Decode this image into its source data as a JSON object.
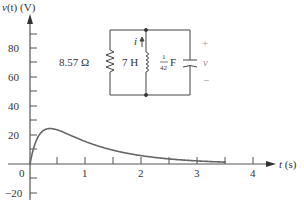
{
  "chart_data": {
    "type": "line",
    "title": "",
    "xlabel": "t (s)",
    "ylabel": "v(t) (V)",
    "xlim": [
      0,
      4.3
    ],
    "ylim": [
      -25,
      95
    ],
    "x_ticks": [
      0,
      0.5,
      1,
      1.5,
      2,
      2.5,
      3,
      3.5,
      4
    ],
    "x_tick_labels": [
      "0",
      "1",
      "2",
      "3",
      "4"
    ],
    "y_ticks": [
      -20,
      -10,
      10,
      20,
      30,
      40,
      50,
      60,
      70,
      80,
      90
    ],
    "y_tick_labels": [
      "80",
      "60",
      "40",
      "20",
      "-20"
    ],
    "grid": false,
    "series": [
      {
        "name": "v(t)",
        "x": [
          0,
          0.05,
          0.1,
          0.15,
          0.2,
          0.25,
          0.3,
          0.36,
          0.45,
          0.5,
          0.6,
          0.75,
          1.0,
          1.25,
          1.5,
          1.75,
          2.0,
          2.25,
          2.5,
          2.75,
          3.0,
          3.25,
          3.5
        ],
        "values": [
          0,
          17.8,
          29.9,
          38.3,
          44.1,
          47.9,
          50.0,
          51.3,
          51.4,
          44.3,
          46.1,
          39.6,
          30.7,
          23.6,
          18.7,
          14.6,
          11.4,
          8.8,
          6.9,
          5.4,
          4.2,
          3.3,
          2.5
        ]
      }
    ],
    "annotations": {
      "circuit": {
        "resistor": "8.57 Ω",
        "inductor": "7 H",
        "capacitor_num": "1",
        "capacitor_den": "42",
        "capacitor_unit": "F",
        "current_label": "i",
        "voltage_label": "v",
        "plus": "+",
        "minus": "−"
      }
    }
  },
  "labels": {
    "ylabel_v": "v",
    "ylabel_t": "(t) (V)",
    "xlabel_t": "t",
    "xlabel_unit": "(s)",
    "y80": "80",
    "y60": "60",
    "y40": "40",
    "y20": "20",
    "y0": "0",
    "yneg20": "−20",
    "x1": "1",
    "x2": "2",
    "x3": "3",
    "x4": "4"
  }
}
